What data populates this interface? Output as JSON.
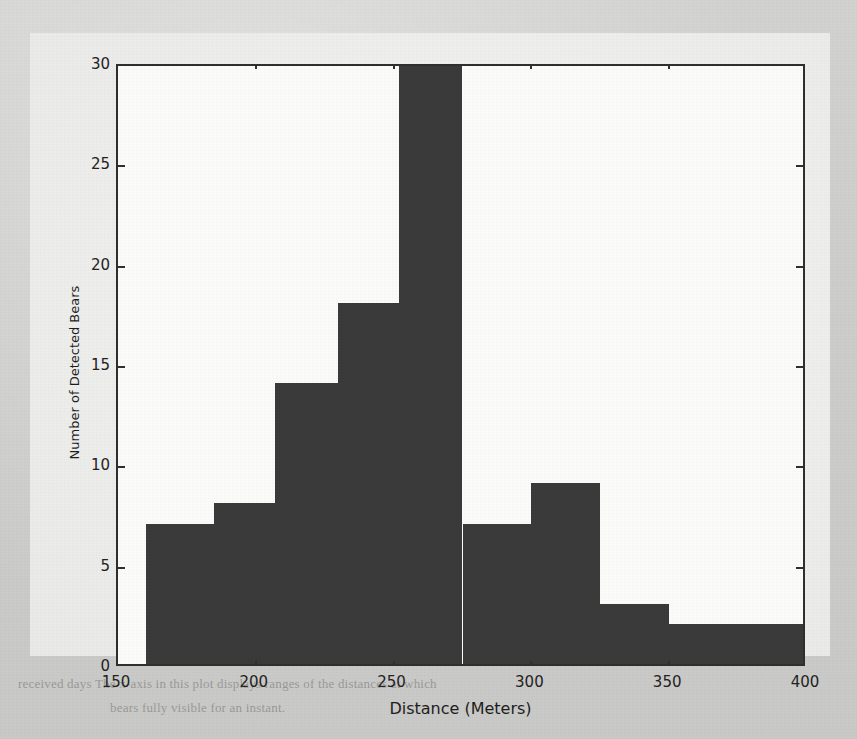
{
  "figure": {
    "background_color": "#eeeeec",
    "page_color": "#cdcdcb",
    "bar_color": "#3a3a3a",
    "axis_color": "#2f2f2f"
  },
  "ghost_text": {
    "line1": "received days  The  x-axis  in  this  plot  displays  ranges  of  the  distances  at  which",
    "line2": "bears  fully  visible  for  an  instant."
  },
  "chart_data": {
    "type": "bar",
    "title": "",
    "xlabel": "Distance (Meters)",
    "ylabel": "Number of Detected Bears",
    "xlim": [
      150,
      400
    ],
    "ylim": [
      0,
      30
    ],
    "grid": false,
    "legend": null,
    "xticks": [
      150,
      200,
      250,
      300,
      350,
      400
    ],
    "xtick_labels": [
      "150",
      "200",
      "250",
      "300",
      "350",
      "400"
    ],
    "yticks": [
      0,
      5,
      10,
      15,
      20,
      25,
      30
    ],
    "ytick_labels": [
      "0",
      "5",
      "10",
      "15",
      "20",
      "25",
      "30"
    ],
    "bin_edges": [
      160,
      185,
      207,
      230,
      252,
      275,
      300,
      325,
      350,
      400
    ],
    "categories": [
      "160-185",
      "185-207",
      "207-230",
      "230-252",
      "252-275",
      "275-300",
      "300-325",
      "325-350",
      "350-400"
    ],
    "values": [
      7,
      8,
      14,
      18,
      30,
      7,
      9,
      3,
      2
    ],
    "clipped_bars": [
      4
    ]
  }
}
